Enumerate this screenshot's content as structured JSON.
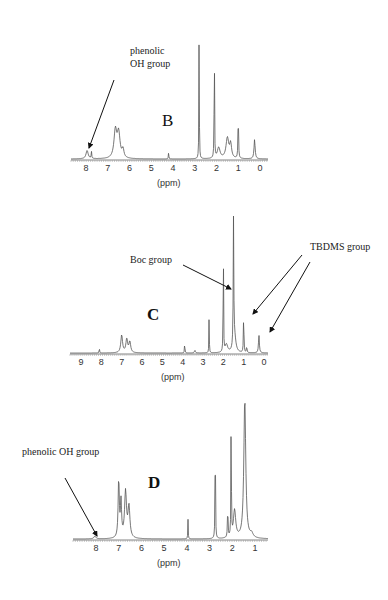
{
  "chart_data": [
    {
      "type": "line",
      "panel": "B",
      "title": "B",
      "xlabel": "(ppm)",
      "ylabel": "",
      "xlim": [
        8.5,
        -0.3
      ],
      "x_ticks": [
        8,
        7,
        6,
        5,
        4,
        3,
        2,
        1,
        0
      ],
      "grid": false,
      "peaks": [
        {
          "ppm": 7.95,
          "height": 0.06,
          "width": 0.12
        },
        {
          "ppm": 7.75,
          "height": 0.05,
          "width": 0.03
        },
        {
          "ppm": 6.65,
          "height": 0.2,
          "width": 0.15
        },
        {
          "ppm": 6.5,
          "height": 0.18,
          "width": 0.15
        },
        {
          "ppm": 6.3,
          "height": 0.06,
          "width": 0.1
        },
        {
          "ppm": 4.2,
          "height": 0.06,
          "width": 0.02
        },
        {
          "ppm": 2.8,
          "height": 1.0,
          "width": 0.02
        },
        {
          "ppm": 2.1,
          "height": 1.0,
          "width": 0.02
        },
        {
          "ppm": 1.9,
          "height": 0.08,
          "width": 0.15
        },
        {
          "ppm": 1.5,
          "height": 0.15,
          "width": 0.15
        },
        {
          "ppm": 1.35,
          "height": 0.1,
          "width": 0.1
        },
        {
          "ppm": 1.0,
          "height": 0.34,
          "width": 0.03
        },
        {
          "ppm": 0.25,
          "height": 0.14,
          "width": 0.06
        }
      ],
      "annotations": [
        {
          "text_lines": [
            "phenolic",
            "OH group"
          ],
          "arrow_to_ppm": 7.95
        }
      ]
    },
    {
      "type": "line",
      "panel": "C",
      "title": "C",
      "xlabel": "(ppm)",
      "ylabel": "",
      "xlim": [
        9.6,
        -0.2
      ],
      "x_ticks": [
        9,
        8,
        7,
        6,
        5,
        4,
        3,
        2,
        1,
        0
      ],
      "grid": false,
      "peaks": [
        {
          "ppm": 8.1,
          "height": 0.05,
          "width": 0.02
        },
        {
          "ppm": 7.0,
          "height": 0.13,
          "width": 0.1
        },
        {
          "ppm": 6.75,
          "height": 0.1,
          "width": 0.1
        },
        {
          "ppm": 6.6,
          "height": 0.08,
          "width": 0.1
        },
        {
          "ppm": 3.9,
          "height": 0.1,
          "width": 0.02
        },
        {
          "ppm": 3.4,
          "height": 0.02,
          "width": 0.05
        },
        {
          "ppm": 2.7,
          "height": 0.3,
          "width": 0.02
        },
        {
          "ppm": 2.0,
          "height": 1.0,
          "width": 0.02
        },
        {
          "ppm": 1.85,
          "height": 0.06,
          "width": 0.15
        },
        {
          "ppm": 1.5,
          "height": 1.0,
          "width": 0.03
        },
        {
          "ppm": 1.45,
          "height": 0.12,
          "width": 0.15
        },
        {
          "ppm": 1.0,
          "height": 0.28,
          "width": 0.03
        },
        {
          "ppm": 0.85,
          "height": 0.05,
          "width": 0.03
        },
        {
          "ppm": 0.25,
          "height": 0.13,
          "width": 0.05
        }
      ],
      "annotations": [
        {
          "text_lines": [
            "Boc group"
          ],
          "arrow_to_ppm": 1.5
        },
        {
          "text_lines": [
            "TBDMS group"
          ],
          "arrow_to_ppm": [
            0.9,
            0.2
          ]
        }
      ]
    },
    {
      "type": "line",
      "panel": "D",
      "title": "D",
      "xlabel": "(ppm)",
      "ylabel": "",
      "xlim": [
        9.0,
        0.5
      ],
      "x_ticks": [
        8,
        7,
        6,
        5,
        4,
        3,
        2,
        1
      ],
      "grid": false,
      "peaks": [
        {
          "ppm": 8.05,
          "height": 0.02,
          "width": 0.1
        },
        {
          "ppm": 7.0,
          "height": 0.42,
          "width": 0.06
        },
        {
          "ppm": 6.9,
          "height": 0.25,
          "width": 0.06
        },
        {
          "ppm": 6.7,
          "height": 0.33,
          "width": 0.1
        },
        {
          "ppm": 6.55,
          "height": 0.22,
          "width": 0.1
        },
        {
          "ppm": 3.95,
          "height": 0.14,
          "width": 0.02
        },
        {
          "ppm": 2.75,
          "height": 1.0,
          "width": 0.02
        },
        {
          "ppm": 2.2,
          "height": 0.22,
          "width": 0.03
        },
        {
          "ppm": 2.05,
          "height": 1.0,
          "width": 0.02
        },
        {
          "ppm": 1.9,
          "height": 0.2,
          "width": 0.12
        },
        {
          "ppm": 1.45,
          "height": 1.0,
          "width": 0.1
        },
        {
          "ppm": 1.15,
          "height": 0.03,
          "width": 0.15
        }
      ],
      "annotations": [
        {
          "text_lines": [
            "phenolic OH group"
          ],
          "arrow_to_ppm": 7.95
        }
      ]
    }
  ],
  "panels": {
    "B": {
      "label": "B",
      "annot1": "phenolic",
      "annot2": "OH group",
      "xlabel": "(ppm)"
    },
    "C": {
      "label": "C",
      "boc": "Boc group",
      "tbdms": "TBDMS group",
      "xlabel": "(ppm)"
    },
    "D": {
      "label": "D",
      "annot": "phenolic OH group",
      "xlabel": "(ppm)"
    }
  }
}
